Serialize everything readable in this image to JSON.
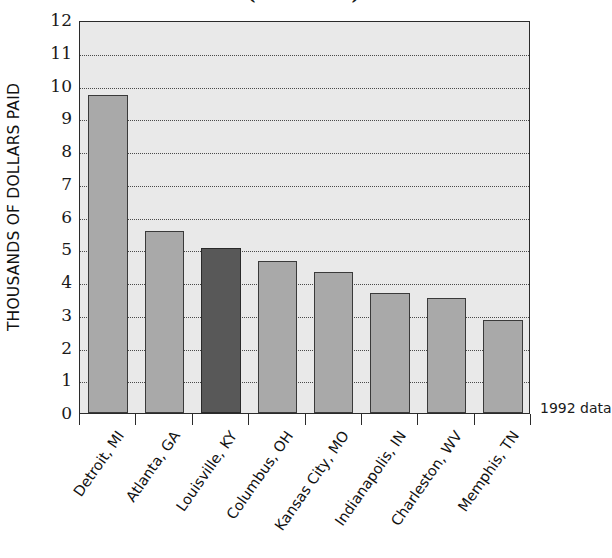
{
  "chart_data": {
    "type": "bar",
    "title": "(continued)",
    "categories": [
      "Detroit, MI",
      "Atlanta, GA",
      "Louisville, KY",
      "Columbus, OH",
      "Kansas City, MO",
      "Indianapolis, IN",
      "Charleston, WV",
      "Memphis, TN"
    ],
    "values": [
      9.7,
      5.55,
      5.05,
      4.65,
      4.3,
      3.65,
      3.5,
      2.85
    ],
    "highlight_index": 2,
    "xlabel": "",
    "ylabel": "THOUSANDS OF DOLLARS PAID",
    "ylim": [
      0,
      12
    ],
    "ytick_labels": [
      "0",
      "1",
      "2",
      "3",
      "4",
      "5",
      "6",
      "7",
      "8",
      "9",
      "10",
      "11",
      "12"
    ],
    "ytick_values": [
      0,
      1,
      2,
      3,
      4,
      5,
      6,
      7,
      8,
      9,
      10,
      11,
      12
    ],
    "grid": true,
    "legend": "none",
    "annotation": "1992 data",
    "colors": {
      "bar": "#a9a9a9",
      "bar_highlight": "#585858",
      "bar_edge": "#3a3a3a",
      "plot_background": "#e9e9e9",
      "axis": "#2b2b2b",
      "grid": "#4a4a4a",
      "text": "#1a1a1a"
    }
  }
}
